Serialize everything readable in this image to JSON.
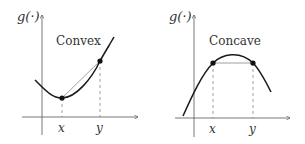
{
  "panels": [
    {
      "id": "convex",
      "title": "Convex",
      "y_axis_label": "g(·)",
      "x_ticks": [
        "x",
        "y"
      ]
    },
    {
      "id": "concave",
      "title": "Concave",
      "y_axis_label": "g(·)",
      "x_ticks": [
        "x",
        "y"
      ]
    }
  ],
  "colors": {
    "curve": "#1a1a1a",
    "axis": "#555555",
    "chord": "#777777",
    "dashed": "#777777",
    "point": "#111111"
  }
}
